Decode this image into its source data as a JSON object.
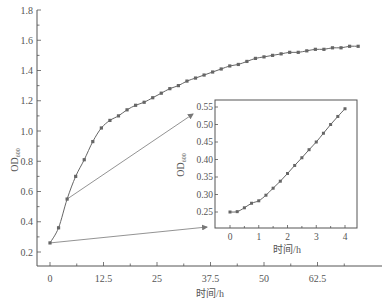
{
  "chart_data": [
    {
      "name": "main",
      "type": "line",
      "title": "",
      "xlabel": "时间/h",
      "ylabel": "OD",
      "ylabel_sub": "600",
      "xlim": [
        -2.5,
        77
      ],
      "ylim": [
        0.1,
        1.8
      ],
      "x_ticks": [
        0,
        12.5,
        25,
        37.5,
        50,
        62.5
      ],
      "x_tick_labels": [
        "0",
        "12.5",
        "25",
        "37.5",
        "50",
        "62.5"
      ],
      "x_minor_ticks": [
        6.25,
        18.75,
        31.25,
        43.75,
        56.25,
        68.75
      ],
      "y_ticks": [
        0.2,
        0.4,
        0.6,
        0.8,
        1.0,
        1.2,
        1.4,
        1.6,
        1.8
      ],
      "y_tick_labels": [
        "0.2",
        "0.4",
        "0.6",
        "0.8",
        "1.0",
        "1.2",
        "1.4",
        "1.6",
        "1.8"
      ],
      "y_minor_ticks": [
        0.3,
        0.5,
        0.7,
        0.9,
        1.1,
        1.3,
        1.5,
        1.7
      ],
      "grid": false,
      "legend": "none",
      "series": [
        {
          "name": "OD600",
          "x": [
            0,
            2,
            4,
            6,
            8,
            10,
            12,
            14,
            16,
            18,
            20,
            22,
            24,
            26,
            28,
            30,
            32,
            34,
            36,
            38,
            40,
            42,
            44,
            46,
            48,
            50,
            52,
            54,
            56,
            58,
            60,
            62,
            64,
            66,
            68,
            70,
            72
          ],
          "y": [
            0.26,
            0.36,
            0.55,
            0.7,
            0.81,
            0.93,
            1.02,
            1.07,
            1.1,
            1.14,
            1.17,
            1.19,
            1.22,
            1.25,
            1.28,
            1.3,
            1.33,
            1.35,
            1.37,
            1.39,
            1.41,
            1.43,
            1.44,
            1.46,
            1.48,
            1.49,
            1.5,
            1.51,
            1.52,
            1.52,
            1.53,
            1.54,
            1.54,
            1.55,
            1.55,
            1.56,
            1.56
          ]
        }
      ],
      "annotations": [
        {
          "type": "arrow",
          "from_point_x": 0,
          "to": "inset-bottom-left"
        },
        {
          "type": "arrow",
          "from_point_x": 4,
          "to": "inset-top-left"
        }
      ]
    },
    {
      "name": "inset",
      "type": "line",
      "title": "",
      "xlabel": "时间/h",
      "ylabel": "OD",
      "ylabel_sub": "600",
      "xlim": [
        -0.3,
        4.4
      ],
      "ylim": [
        0.235,
        0.57
      ],
      "x_ticks": [
        0,
        1,
        2,
        3,
        4
      ],
      "x_tick_labels": [
        "0",
        "1",
        "2",
        "3",
        "4"
      ],
      "x_minor_ticks": [
        0.5,
        1.5,
        2.5,
        3.5
      ],
      "y_ticks": [
        0.25,
        0.3,
        0.35,
        0.4,
        0.45,
        0.5,
        0.55
      ],
      "y_tick_labels": [
        "0.25",
        "0.30",
        "0.35",
        "0.40",
        "0.45",
        "0.50",
        "0.55"
      ],
      "grid": false,
      "legend": "none",
      "series": [
        {
          "name": "OD600",
          "x": [
            0,
            0.25,
            0.5,
            0.75,
            1,
            1.25,
            1.5,
            1.75,
            2,
            2.25,
            2.5,
            2.75,
            3,
            3.25,
            3.5,
            3.75,
            4
          ],
          "y": [
            0.25,
            0.251,
            0.262,
            0.275,
            0.282,
            0.298,
            0.318,
            0.338,
            0.36,
            0.383,
            0.405,
            0.428,
            0.45,
            0.475,
            0.5,
            0.523,
            0.545
          ]
        }
      ]
    }
  ]
}
